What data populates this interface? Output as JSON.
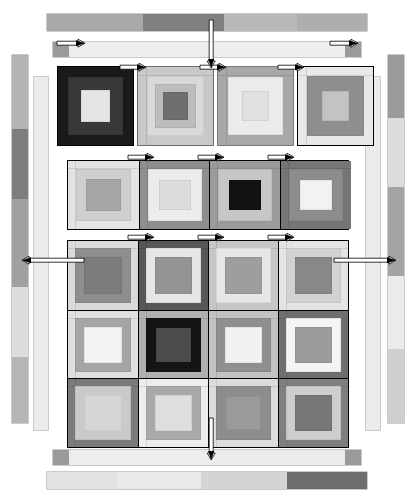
{
  "diagram": {
    "kind": "quilt-block-assembly",
    "canvas": {
      "width": 414,
      "height": 499,
      "background": "#ffffff"
    },
    "palette": {
      "black": "#111111",
      "very_dark": "#1d1d1d",
      "dark": "#3f3f3f",
      "dark_gray": "#5a5a5a",
      "mid_dark": "#707070",
      "mid": "#8a8a8a",
      "mid_light": "#a3a3a3",
      "light": "#c4c4c4",
      "lighter": "#d8d8d8",
      "pale": "#e6e6e6",
      "near_white": "#f1f1f1",
      "white": "#fafafa",
      "outline": "#000000",
      "arrow_fill": "#ffffff",
      "arrow_stroke": "#000000"
    },
    "arrows": {
      "count": 17,
      "style": "thin white bar with black arrowhead",
      "horizontal_label": "sewing-direction-arrow-horizontal",
      "vertical_label": "sewing-direction-arrow-vertical"
    },
    "top_borders": [
      {
        "name": "top-outer-border-strip",
        "x": 47,
        "y": 14,
        "w": 320,
        "h": 17,
        "segments": [
          {
            "color": "#a8a8a8",
            "flex": 33
          },
          {
            "color": "#7f7f7f",
            "flex": 28
          },
          {
            "color": "#b9b9b9",
            "flex": 25
          },
          {
            "color": "#aeaeae",
            "flex": 24
          }
        ]
      },
      {
        "name": "top-inner-border-strip",
        "x": 53,
        "y": 42,
        "w": 308,
        "h": 15,
        "segments": [
          {
            "color": "#9a9a9a",
            "flex": 5
          },
          {
            "color": "#ededed",
            "flex": 43
          },
          {
            "color": "#efefef",
            "flex": 42
          },
          {
            "color": "#9a9a9a",
            "flex": 5
          }
        ]
      }
    ],
    "bottom_borders": [
      {
        "name": "bottom-inner-border-strip",
        "x": 53,
        "y": 450,
        "w": 308,
        "h": 15,
        "segments": [
          {
            "color": "#9a9a9a",
            "flex": 5
          },
          {
            "color": "#ededed",
            "flex": 43
          },
          {
            "color": "#ebebeb",
            "flex": 42
          },
          {
            "color": "#9a9a9a",
            "flex": 5
          }
        ]
      },
      {
        "name": "bottom-outer-border-strip",
        "x": 47,
        "y": 472,
        "w": 320,
        "h": 17,
        "segments": [
          {
            "color": "#e2e2e2",
            "flex": 22
          },
          {
            "color": "#e9e9e9",
            "flex": 26
          },
          {
            "color": "#d4d4d4",
            "flex": 27
          },
          {
            "color": "#6d6d6d",
            "flex": 25
          }
        ]
      }
    ],
    "left_borders": [
      {
        "name": "left-outer-border-strip",
        "x": 12,
        "y": 55,
        "w": 16,
        "h": 368,
        "segments": [
          {
            "color": "#b4b4b4",
            "flex": 20
          },
          {
            "color": "#7d7d7d",
            "flex": 19
          },
          {
            "color": "#a0a0a0",
            "flex": 24
          },
          {
            "color": "#dcdcdc",
            "flex": 19
          },
          {
            "color": "#b6b6b6",
            "flex": 18
          }
        ]
      },
      {
        "name": "left-inner-border-strip",
        "x": 34,
        "y": 77,
        "w": 14,
        "h": 353,
        "segments": [
          {
            "color": "#ececec",
            "flex": 100
          }
        ]
      }
    ],
    "right_borders": [
      {
        "name": "right-inner-border-strip",
        "x": 366,
        "y": 77,
        "w": 14,
        "h": 353,
        "segments": [
          {
            "color": "#ececec",
            "flex": 100
          }
        ]
      },
      {
        "name": "right-outer-border-strip",
        "x": 388,
        "y": 55,
        "w": 16,
        "h": 368,
        "segments": [
          {
            "color": "#9a9a9a",
            "flex": 17
          },
          {
            "color": "#dcdcdc",
            "flex": 19
          },
          {
            "color": "#a4a4a4",
            "flex": 24
          },
          {
            "color": "#ececec",
            "flex": 20
          },
          {
            "color": "#cfcfcf",
            "flex": 20
          }
        ]
      }
    ],
    "row_top": {
      "name": "detached-top-block-row",
      "y": 66,
      "h": 80,
      "blocks": [
        {
          "name": "block-top-1",
          "x": 57,
          "w": 77,
          "outline": "#000000",
          "rings": [
            {
              "color": "#1a1a1a",
              "inset": 0
            },
            {
              "color": "#383838",
              "inset": 10
            },
            {
              "color": "#e4e4e4",
              "inset": 23
            }
          ]
        },
        {
          "name": "block-top-2",
          "x": 137,
          "w": 77,
          "outline": "#6e6e6e",
          "rings": [
            {
              "color": "#c9c9c9",
              "inset": 0
            },
            {
              "color": "#d9d9d9",
              "inset": 9
            },
            {
              "color": "#bdbdbd",
              "inset": 17
            },
            {
              "color": "#6f6f6f",
              "inset": 25
            }
          ]
        },
        {
          "name": "block-top-3",
          "x": 217,
          "w": 77,
          "outline": "#7a7a7a",
          "rings": [
            {
              "color": "#a8a8a8",
              "inset": 0
            },
            {
              "color": "#ebebeb",
              "inset": 10
            },
            {
              "color": "#e0e0e0",
              "inset": 24
            }
          ]
        },
        {
          "name": "block-top-4",
          "x": 297,
          "w": 77,
          "outline": "#000000",
          "rings": [
            {
              "color": "#e8e8e8",
              "inset": 0
            },
            {
              "color": "#8e8e8e",
              "inset": 9
            },
            {
              "color": "#c3c3c3",
              "inset": 24
            }
          ]
        }
      ]
    },
    "row_second": {
      "name": "detached-second-block-row",
      "x": 67,
      "y": 160,
      "w": 282,
      "h": 70,
      "outline": "#000000",
      "blocks": [
        {
          "name": "block-row2-1",
          "rings": [
            {
              "color": "#e3e3e3",
              "inset": 0
            },
            {
              "color": "#cfcfcf",
              "inset": 8
            },
            {
              "color": "#a6a6a6",
              "inset": 18
            }
          ]
        },
        {
          "name": "block-row2-2",
          "rings": [
            {
              "color": "#8e8e8e",
              "inset": 0
            },
            {
              "color": "#ececec",
              "inset": 8
            },
            {
              "color": "#dcdcdc",
              "inset": 19
            }
          ]
        },
        {
          "name": "block-row2-3",
          "rings": [
            {
              "color": "#9b9b9b",
              "inset": 0
            },
            {
              "color": "#c6c6c6",
              "inset": 8
            },
            {
              "color": "#111111",
              "inset": 19
            }
          ]
        },
        {
          "name": "block-row2-4",
          "rings": [
            {
              "color": "#757575",
              "inset": 0
            },
            {
              "color": "#8c8c8c",
              "inset": 8
            },
            {
              "color": "#f2f2f2",
              "inset": 19
            }
          ]
        }
      ]
    },
    "main_grid": {
      "name": "main-quilt-center-grid",
      "x": 67,
      "y": 240,
      "w": 282,
      "h": 208,
      "cols": 4,
      "rows": 3,
      "outline": "#000000",
      "blocks": [
        {
          "name": "block-r1c1",
          "rings": [
            {
              "color": "#dadada",
              "inset": 0
            },
            {
              "color": "#8e8e8e",
              "inset": 7
            },
            {
              "color": "#7c7c7c",
              "inset": 16
            }
          ]
        },
        {
          "name": "block-r1c2",
          "rings": [
            {
              "color": "#575757",
              "inset": 0
            },
            {
              "color": "#e6e6e6",
              "inset": 7
            },
            {
              "color": "#949494",
              "inset": 16
            }
          ]
        },
        {
          "name": "block-r1c3",
          "rings": [
            {
              "color": "#c6c6c6",
              "inset": 0
            },
            {
              "color": "#e7e7e7",
              "inset": 7
            },
            {
              "color": "#9e9e9e",
              "inset": 16
            }
          ]
        },
        {
          "name": "block-r1c4",
          "rings": [
            {
              "color": "#e4e4e4",
              "inset": 0
            },
            {
              "color": "#d2d2d2",
              "inset": 7
            },
            {
              "color": "#888888",
              "inset": 16
            }
          ]
        },
        {
          "name": "block-r2c1",
          "rings": [
            {
              "color": "#e0e0e0",
              "inset": 0
            },
            {
              "color": "#a5a5a5",
              "inset": 7
            },
            {
              "color": "#f2f2f2",
              "inset": 16
            }
          ]
        },
        {
          "name": "block-r2c2",
          "rings": [
            {
              "color": "#b0b0b0",
              "inset": 0
            },
            {
              "color": "#141414",
              "inset": 7
            },
            {
              "color": "#4c4c4c",
              "inset": 17
            }
          ]
        },
        {
          "name": "block-r2c3",
          "rings": [
            {
              "color": "#c2c2c2",
              "inset": 0
            },
            {
              "color": "#8f8f8f",
              "inset": 7
            },
            {
              "color": "#f1f1f1",
              "inset": 16
            }
          ]
        },
        {
          "name": "block-r2c4",
          "rings": [
            {
              "color": "#6f6f6f",
              "inset": 0
            },
            {
              "color": "#f4f4f4",
              "inset": 7
            },
            {
              "color": "#9c9c9c",
              "inset": 16
            }
          ]
        },
        {
          "name": "block-r3c1",
          "rings": [
            {
              "color": "#7b7b7b",
              "inset": 0
            },
            {
              "color": "#cacaca",
              "inset": 7
            },
            {
              "color": "#d6d6d6",
              "inset": 16
            }
          ]
        },
        {
          "name": "block-r3c2",
          "rings": [
            {
              "color": "#ededed",
              "inset": 0
            },
            {
              "color": "#a9a9a9",
              "inset": 7
            },
            {
              "color": "#dedede",
              "inset": 16
            }
          ]
        },
        {
          "name": "block-r3c3",
          "rings": [
            {
              "color": "#dcdcdc",
              "inset": 0
            },
            {
              "color": "#8d8d8d",
              "inset": 7
            },
            {
              "color": "#9a9a9a",
              "inset": 17
            }
          ]
        },
        {
          "name": "block-r3c4",
          "rings": [
            {
              "color": "#7f7f7f",
              "inset": 0
            },
            {
              "color": "#cdcdcd",
              "inset": 7
            },
            {
              "color": "#767676",
              "inset": 16
            }
          ]
        }
      ]
    },
    "arrow_list": [
      {
        "name": "arrow-top-strip-left",
        "type": "h",
        "dir": "right",
        "x": 57,
        "y": 38,
        "len": 28
      },
      {
        "name": "arrow-top-strip-right",
        "type": "h",
        "dir": "right",
        "x": 330,
        "y": 38,
        "len": 28
      },
      {
        "name": "arrow-toprow-1",
        "type": "h",
        "dir": "right",
        "x": 120,
        "y": 62,
        "len": 26
      },
      {
        "name": "arrow-toprow-2",
        "type": "h",
        "dir": "right",
        "x": 200,
        "y": 62,
        "len": 26
      },
      {
        "name": "arrow-toprow-3",
        "type": "h",
        "dir": "right",
        "x": 278,
        "y": 62,
        "len": 26
      },
      {
        "name": "arrow-row2-1",
        "type": "h",
        "dir": "right",
        "x": 128,
        "y": 152,
        "len": 26
      },
      {
        "name": "arrow-row2-2",
        "type": "h",
        "dir": "right",
        "x": 198,
        "y": 152,
        "len": 26
      },
      {
        "name": "arrow-row2-3",
        "type": "h",
        "dir": "right",
        "x": 268,
        "y": 152,
        "len": 26
      },
      {
        "name": "arrow-row3-1",
        "type": "h",
        "dir": "right",
        "x": 128,
        "y": 232,
        "len": 26
      },
      {
        "name": "arrow-row3-2",
        "type": "h",
        "dir": "right",
        "x": 198,
        "y": 232,
        "len": 26
      },
      {
        "name": "arrow-row3-3",
        "type": "h",
        "dir": "right",
        "x": 268,
        "y": 232,
        "len": 26
      },
      {
        "name": "arrow-left-side",
        "type": "h",
        "dir": "left",
        "x": 22,
        "y": 255,
        "len": 62
      },
      {
        "name": "arrow-right-side",
        "type": "h",
        "dir": "right",
        "x": 334,
        "y": 255,
        "len": 62
      },
      {
        "name": "arrow-top-vertical",
        "type": "v",
        "dir": "down",
        "x": 206,
        "y": 20,
        "len": 48
      },
      {
        "name": "arrow-bottom-vertical",
        "type": "v",
        "dir": "down",
        "x": 206,
        "y": 418,
        "len": 42
      }
    ]
  }
}
